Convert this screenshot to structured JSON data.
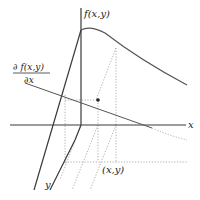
{
  "diagram": {
    "labels": {
      "f_axis": "f(x,y)",
      "x_axis": "x",
      "y_axis": "y",
      "point": "(x,y)",
      "partial_numerator": "∂ f(x,y)",
      "partial_denominator": "∂x"
    },
    "colors": {
      "axis": "#3a3a3a",
      "curve": "#555555",
      "dotted": "#999999",
      "background": "#ffffff"
    }
  }
}
